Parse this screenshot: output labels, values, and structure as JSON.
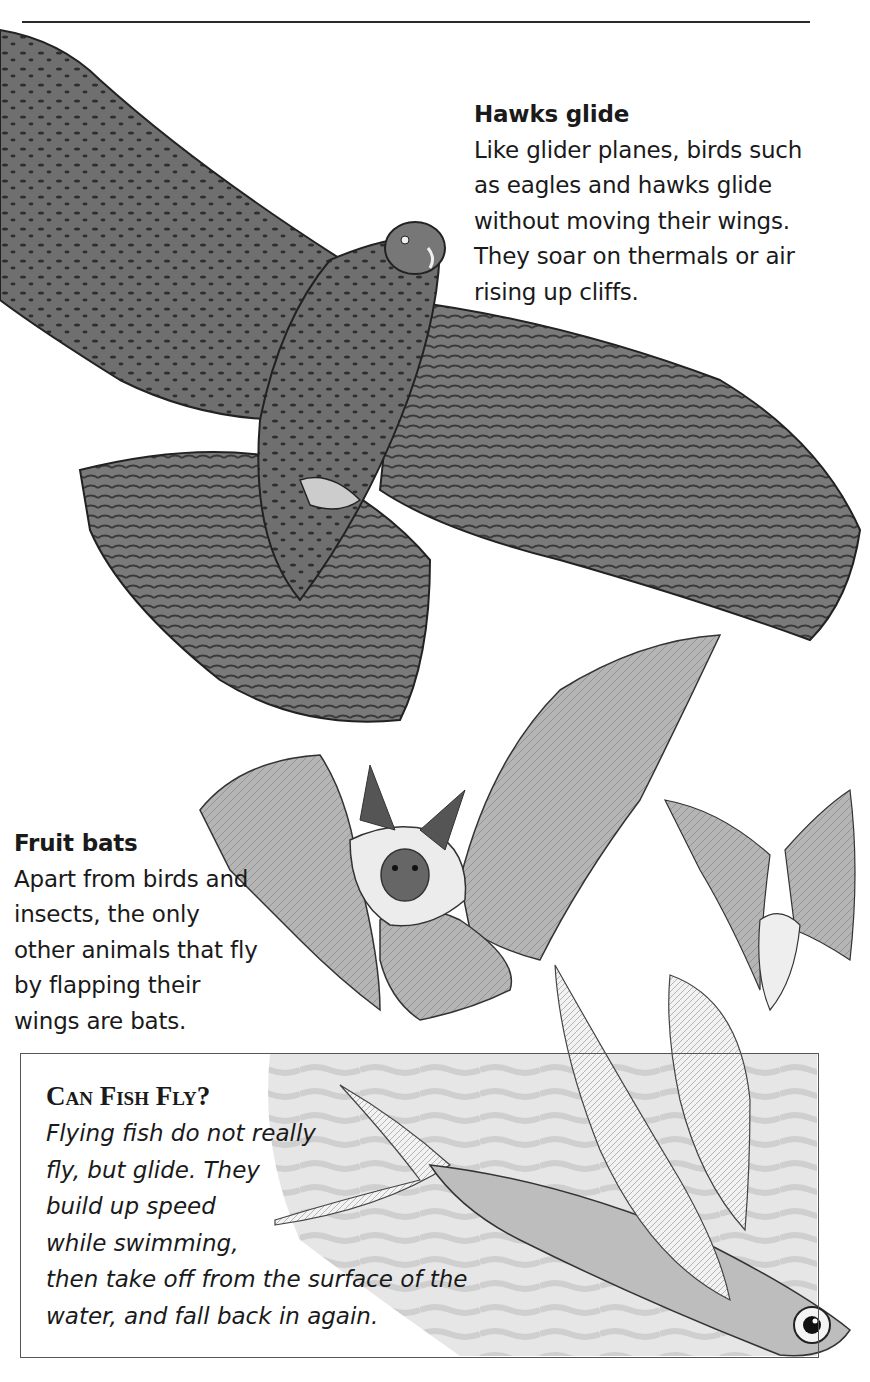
{
  "page": {
    "top_rule": true,
    "colors": {
      "text": "#1a1a1a",
      "rule": "#2a2a2a",
      "box_border": "#555555",
      "water": "#d4d4d4"
    }
  },
  "hawk": {
    "title": "Hawks glide",
    "lines": [
      "Like glider planes, birds such",
      "as eagles and hawks glide",
      "without moving their wings.",
      "They soar on thermals or air",
      "rising up cliffs."
    ],
    "illustration": "hawk-gliding-illustration"
  },
  "bats": {
    "title": "Fruit bats",
    "lines": [
      "Apart from birds and",
      "insects, the only",
      "other animals that fly",
      "by flapping their",
      "wings are bats."
    ],
    "illustrations": [
      "large-bat-illustration",
      "small-bat-illustration"
    ]
  },
  "fish_box": {
    "title": "Can Fish Fly?",
    "lines": [
      "Flying fish do not really",
      "fly, but glide. They",
      "build up speed",
      "while swimming,",
      "then take off from the surface of the",
      "water, and fall back in again."
    ],
    "illustration": "flying-fish-illustration"
  }
}
